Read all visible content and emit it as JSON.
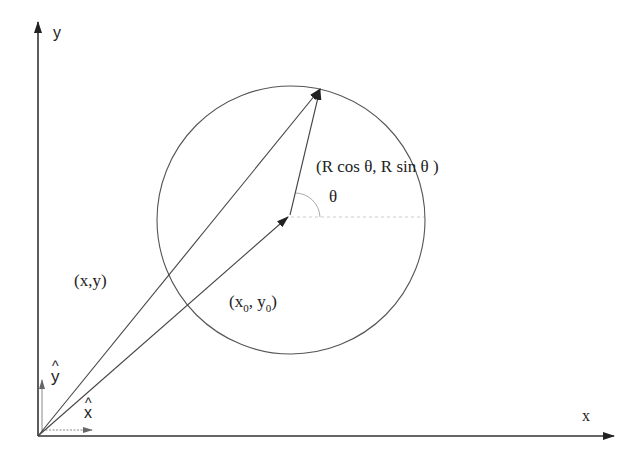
{
  "diagram": {
    "type": "vector-geometry",
    "axes": {
      "x_label": "x",
      "y_label": "y",
      "origin": [
        38,
        436
      ]
    },
    "unit_vectors": {
      "x_hat_label": "x",
      "y_hat_label": "y",
      "hat_glyph": "^"
    },
    "circle": {
      "center": [
        291,
        220
      ],
      "radius": 134,
      "center_label_x": "(x",
      "center_label_sub1": "0",
      "center_label_mid": ", y",
      "center_label_sub2": "0",
      "center_label_end": ")"
    },
    "position_label": "(x,y)",
    "radius_vector_label": "(R cos  θ, R sin θ )",
    "angle_label": "θ",
    "point_on_circle": [
      320,
      88
    ],
    "colors": {
      "line": "#444444",
      "text": "#222222",
      "dashed": "#bbbbbb"
    }
  }
}
